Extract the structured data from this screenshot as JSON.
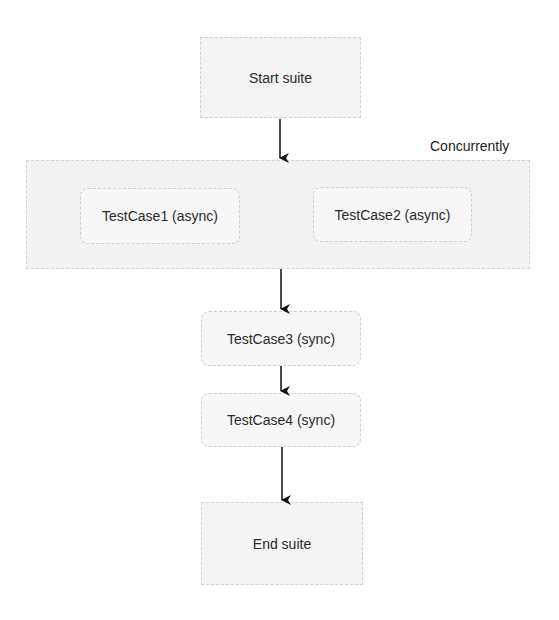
{
  "diagram": {
    "nodes": {
      "start": "Start suite",
      "tc1": "TestCase1 (async)",
      "tc2": "TestCase2 (async)",
      "tc3": "TestCase3 (sync)",
      "tc4": "TestCase4 (sync)",
      "end": "End suite"
    },
    "group_label": "Concurrently",
    "edges": [
      [
        "Start suite",
        "Concurrently group"
      ],
      [
        "Concurrently group",
        "TestCase3 (sync)"
      ],
      [
        "TestCase3 (sync)",
        "TestCase4 (sync)"
      ],
      [
        "TestCase4 (sync)",
        "End suite"
      ]
    ]
  }
}
